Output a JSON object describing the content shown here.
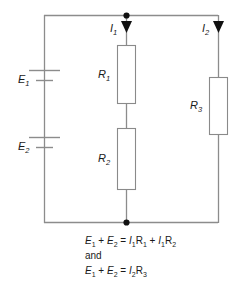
{
  "diagram": {
    "colors": {
      "wire": "#8c8c8c",
      "resistor_border": "#8a8a8a",
      "resistor_fill": "#ffffff",
      "junction_dot": "#111111",
      "arrow": "#111111",
      "text": "#1a1a1a",
      "background": "#ffffff"
    },
    "sources": [
      {
        "id": "E1",
        "label": "E",
        "subscript": "1",
        "name": "battery-e1"
      },
      {
        "id": "E2",
        "label": "E",
        "subscript": "2",
        "name": "battery-e2"
      }
    ],
    "resistors": [
      {
        "id": "R1",
        "label": "R",
        "subscript": "1",
        "name": "resistor-r1"
      },
      {
        "id": "R2",
        "label": "R",
        "subscript": "2",
        "name": "resistor-r2"
      },
      {
        "id": "R3",
        "label": "R",
        "subscript": "3",
        "name": "resistor-r3"
      }
    ],
    "currents": [
      {
        "id": "I1",
        "label": "I",
        "subscript": "1",
        "name": "current-i1",
        "direction": "down"
      },
      {
        "id": "I2",
        "label": "I",
        "subscript": "2",
        "name": "current-i2",
        "direction": "down"
      }
    ],
    "equations": {
      "line1": {
        "lhs_a": "E",
        "lhs_a_sub": "1",
        "plus1": "+",
        "lhs_b": "E",
        "lhs_b_sub": "2",
        "equals": "=",
        "rhs_a_i": "I",
        "rhs_a_i_sub": "1",
        "rhs_a_r": "R",
        "rhs_a_r_sub": "1",
        "plus2": "+",
        "rhs_b_i": "I",
        "rhs_b_i_sub": "1",
        "rhs_b_r": "R",
        "rhs_b_r_sub": "2"
      },
      "conjunction": "and",
      "line2": {
        "lhs_a": "E",
        "lhs_a_sub": "1",
        "plus1": "+",
        "lhs_b": "E",
        "lhs_b_sub": "2",
        "equals": "=",
        "rhs_i": "I",
        "rhs_i_sub": "2",
        "rhs_r": "R",
        "rhs_r_sub": "3"
      }
    }
  }
}
